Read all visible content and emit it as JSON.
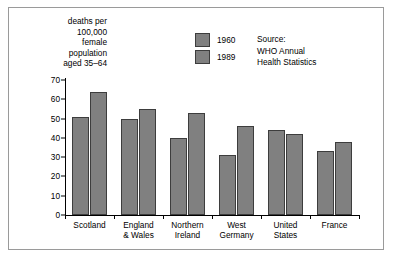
{
  "chart_data": {
    "type": "bar",
    "title": "",
    "subtitle": "",
    "xlabel": "",
    "ylabel": "deaths per\n100,000\nfemale\npopulation\naged 35–64",
    "categories": [
      "Scotland",
      "England\n& Wales",
      "Northern\nIreland",
      "West\nGermany",
      "United\nStates",
      "France"
    ],
    "series": [
      {
        "name": "1960",
        "values": [
          51,
          50,
          40,
          31,
          44,
          33
        ]
      },
      {
        "name": "1989",
        "values": [
          64,
          55,
          53,
          46,
          42,
          38
        ]
      }
    ],
    "ylim": [
      0,
      70
    ],
    "yticks": [
      0,
      10,
      20,
      30,
      40,
      50,
      60,
      70
    ],
    "ytick_labels": [
      "0",
      "10",
      "20",
      "30",
      "40",
      "50",
      "60",
      "70"
    ],
    "grid": false,
    "legend_position": "top-center",
    "annotations": [
      "Source:\nWHO Annual\nHealth Statistics"
    ],
    "bar_color": "#808080",
    "bar_border_color": "#3d3d3d",
    "axis_color": "#000000",
    "frame_color": "#9a9a9a",
    "background": "#ffffff"
  },
  "legend": {
    "items": [
      {
        "label": "1960"
      },
      {
        "label": "1989"
      }
    ]
  },
  "source_note": "Source:\nWHO Annual\nHealth Statistics"
}
